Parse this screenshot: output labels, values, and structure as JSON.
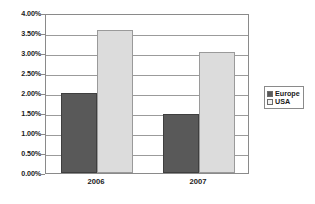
{
  "chart_data": {
    "type": "bar",
    "title": "",
    "subtitle": "",
    "xlabel": "",
    "ylabel": "",
    "categories": [
      "2006",
      "2007"
    ],
    "series": [
      {
        "name": "Europe",
        "color": "#595959",
        "values": [
          2.0,
          1.47
        ]
      },
      {
        "name": "USA",
        "color": "#dcdcdc",
        "values": [
          3.58,
          3.02
        ]
      }
    ],
    "ylim": [
      0,
      4
    ],
    "ytick_values": [
      0,
      0.5,
      1.0,
      1.5,
      2.0,
      2.5,
      3.0,
      3.5,
      4.0
    ],
    "ytick_labels": [
      "0.00%",
      "0.50%",
      "1.00%",
      "1.50%",
      "2.00%",
      "2.50%",
      "3.00%",
      "3.50%",
      "4.00%"
    ],
    "value_format": "percent",
    "grid": {
      "horizontal": true,
      "vertical": false
    },
    "legend": {
      "position": "right",
      "entries": [
        {
          "label": "Europe",
          "swatch_color": "#595959"
        },
        {
          "label": "USA",
          "swatch_color": "#f2f2f2"
        }
      ]
    },
    "plot_border_color": "#8a8a8a",
    "gridline_color": "#9b9b9b",
    "background_color": "#ffffff"
  }
}
